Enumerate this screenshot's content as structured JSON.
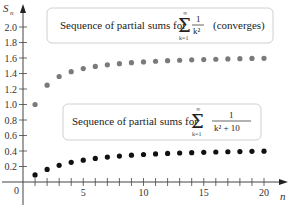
{
  "chart_data": {
    "type": "scatter",
    "title": "",
    "xlabel": "n",
    "ylabel": "S_n",
    "xlim": [
      0,
      21
    ],
    "ylim": [
      0,
      2.1
    ],
    "x_ticks": [
      5,
      10,
      15,
      20
    ],
    "x_tick_labels": [
      "5",
      "10",
      "15",
      "20"
    ],
    "y_ticks": [
      0.2,
      0.4,
      0.6,
      0.8,
      1.0,
      1.2,
      1.4,
      1.6,
      1.8,
      2.0
    ],
    "y_tick_labels": [
      "0.2",
      "0.4",
      "0.6",
      "0.8",
      "1.0",
      "1.2",
      "1.4",
      "1.6",
      "1.8",
      "2.0"
    ],
    "origin_label": "0",
    "grid": false,
    "x": [
      1,
      2,
      3,
      4,
      5,
      6,
      7,
      8,
      9,
      10,
      11,
      12,
      13,
      14,
      15,
      16,
      17,
      18,
      19,
      20
    ],
    "series": [
      {
        "name": "Sequence of partial sums for sum_{k=1}^{inf} 1/k^2 (converges)",
        "color": "#7a7a7a",
        "values": [
          1.0,
          1.25,
          1.361,
          1.424,
          1.464,
          1.491,
          1.512,
          1.527,
          1.54,
          1.55,
          1.558,
          1.565,
          1.571,
          1.576,
          1.58,
          1.584,
          1.588,
          1.591,
          1.594,
          1.596
        ]
      },
      {
        "name": "Sequence of partial sums for sum_{k=1}^{inf} 1/(k^2 + 10)",
        "color": "#111111",
        "values": [
          0.091,
          0.162,
          0.215,
          0.254,
          0.282,
          0.304,
          0.321,
          0.335,
          0.346,
          0.355,
          0.362,
          0.369,
          0.374,
          0.379,
          0.383,
          0.387,
          0.39,
          0.393,
          0.396,
          0.398
        ]
      }
    ],
    "annotations": [
      {
        "prefix": "Sequence of partial sums for",
        "sigma": "Σ",
        "sigma_top": "∞",
        "sigma_bottom": "k=1",
        "numerator": "1",
        "denominator": "k²",
        "suffix": "(converges)"
      },
      {
        "prefix": "Sequence of partial sums for",
        "sigma": "Σ",
        "sigma_top": "∞",
        "sigma_bottom": "k=1",
        "numerator": "1",
        "denominator": "k² + 10",
        "suffix": ""
      }
    ]
  }
}
